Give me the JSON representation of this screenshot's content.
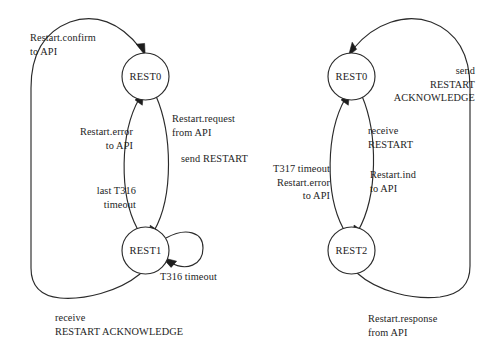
{
  "diagram": {
    "background_color": "#ffffff",
    "line_color": "#2b2b2b",
    "text_color": "#1d1d1d"
  },
  "left_machine": {
    "name": "originating-side-restart-state-machine",
    "nodes": [
      {
        "id": "rest0",
        "label": "REST0",
        "cx": 145.5,
        "cy": 76.5,
        "r": 23.5
      },
      {
        "id": "rest1",
        "label": "REST1",
        "cx": 145.5,
        "cy": 250.5,
        "r": 23.5
      }
    ],
    "labels": {
      "restart_confirm": {
        "line1": "Restart.confirm",
        "line2": "to API"
      },
      "restart_error": {
        "line1": "Restart.error",
        "line2": "to API"
      },
      "restart_request": {
        "line1": "Restart.request",
        "line2": "from API",
        "line3": "send RESTART"
      },
      "last_t316": {
        "line1": "last T316",
        "line2": "timeout"
      },
      "t316_timeout": {
        "line1": "T316 timeout"
      },
      "receive_restart_ack": {
        "line1": "receive",
        "line2": "RESTART ACKNOWLEDGE"
      }
    }
  },
  "right_machine": {
    "name": "destination-side-restart-state-machine",
    "nodes": [
      {
        "id": "rest0",
        "label": "REST0",
        "cx": 351.5,
        "cy": 76.5,
        "r": 23.5
      },
      {
        "id": "rest2",
        "label": "REST2",
        "cx": 351.5,
        "cy": 250.5,
        "r": 23.5
      }
    ],
    "labels": {
      "send_restart_ack": {
        "line1": "send",
        "line2": "RESTART",
        "line3": "ACKNOWLEDGE"
      },
      "receive_restart": {
        "line1": "receive",
        "line2": "RESTART"
      },
      "t317_timeout": {
        "line1": "T317 timeout",
        "line2": "Restart.error",
        "line3": "to API"
      },
      "restart_ind": {
        "line1": "Restart.ind",
        "line2": "to API"
      },
      "restart_response": {
        "line1": "Restart.response",
        "line2": "from API"
      }
    }
  }
}
